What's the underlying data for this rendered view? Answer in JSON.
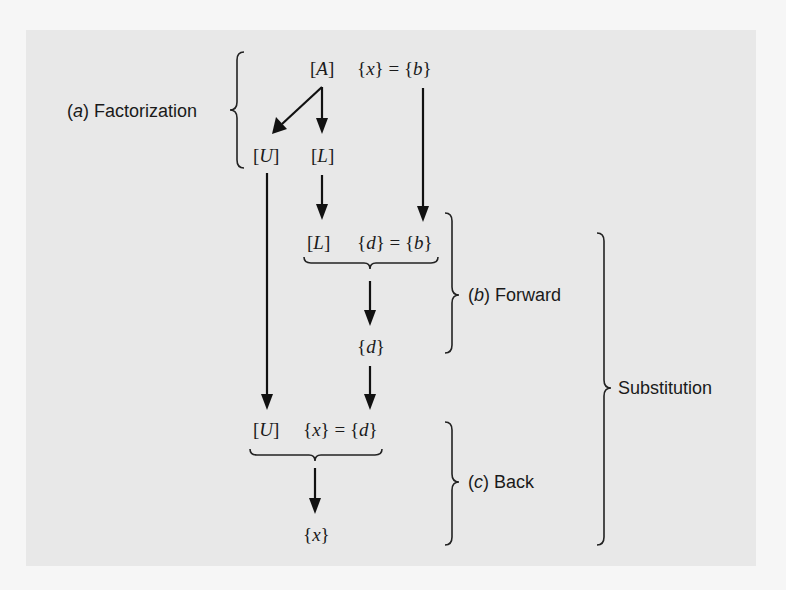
{
  "diagram": {
    "type": "flowchart",
    "nodes": {
      "A": {
        "open": "[",
        "var": "A",
        "close": "]"
      },
      "x_eq_b": {
        "lhs": "x",
        "rhs": "b"
      },
      "U_top": {
        "open": "[",
        "var": "U",
        "close": "]"
      },
      "L_top": {
        "open": "[",
        "var": "L",
        "close": "]"
      },
      "L_mid": {
        "open": "[",
        "var": "L",
        "close": "]"
      },
      "d_eq_b": {
        "lhs": "d",
        "rhs": "b"
      },
      "d_result": {
        "var": "d"
      },
      "U_low": {
        "open": "[",
        "var": "U",
        "close": "]"
      },
      "x_eq_d": {
        "lhs": "x",
        "rhs": "d"
      },
      "x_result": {
        "var": "x"
      }
    },
    "labels": {
      "factorization": {
        "prefix_open": "(",
        "letter": "a",
        "prefix_close": ")",
        "text": " Factorization"
      },
      "forward": {
        "prefix_open": "(",
        "letter": "b",
        "prefix_close": ")",
        "text": " Forward"
      },
      "back": {
        "prefix_open": "(",
        "letter": "c",
        "prefix_close": ")",
        "text": " Back"
      },
      "substitution": "Substitution"
    },
    "edges": [
      {
        "from": "A",
        "to": "U_top"
      },
      {
        "from": "A",
        "to": "L_top"
      },
      {
        "from": "L_top",
        "to": "L_mid"
      },
      {
        "from": "x_eq_b",
        "to": "d_eq_b"
      },
      {
        "from": "d_eq_b",
        "to": "d_result"
      },
      {
        "from": "U_top",
        "to": "U_low"
      },
      {
        "from": "d_result",
        "to": "x_eq_d"
      },
      {
        "from": "x_eq_d",
        "to": "x_result"
      }
    ],
    "colors": {
      "panel": "#e8e8e8",
      "background": "#f6f6f6",
      "ink": "#111111"
    }
  }
}
